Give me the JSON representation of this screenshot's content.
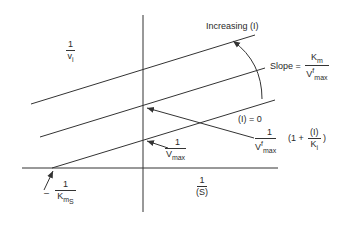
{
  "diagram": {
    "type": "Lineweaver-Burk plot with inhibitor",
    "y_axis_label": {
      "num": "1",
      "den": "v",
      "den_sub": "i"
    },
    "x_axis_label": {
      "num": "1",
      "den": "(S)"
    },
    "increasing_label": "Increasing  (I)",
    "slope_label": {
      "prefix": "Slope  =",
      "num": "K",
      "num_sub": "m",
      "den": "V",
      "den_sup": "f",
      "den_sub": "max"
    },
    "zero_label": "(I) = 0",
    "intercept_label": {
      "num": "1",
      "den": "V",
      "den_sub": "max"
    },
    "inhibited_intercept_label": {
      "num": "1",
      "den": "V",
      "den_sup": "f",
      "den_sub": "max",
      "factor_open": "(1 +",
      "factor_num": "(I)",
      "factor_den": "K",
      "factor_den_sub": "i",
      "factor_close": ")"
    },
    "x_intercept_label": {
      "prefix": "–",
      "num": "1",
      "den": "K",
      "den_sub": "m",
      "den_subsub": "S"
    },
    "line_color": "#333333"
  }
}
